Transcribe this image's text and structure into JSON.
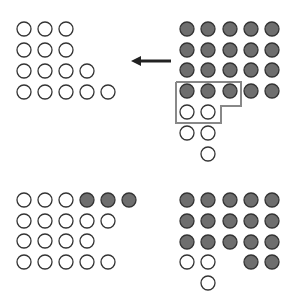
{
  "colors": {
    "background": "#ffffff",
    "filled": "#6e6e6e",
    "stroke": "#333333",
    "bracket": "#888888",
    "arrow": "#222222"
  },
  "radius": 7,
  "panels": [
    {
      "name": "top-left-after",
      "circles": [
        {
          "x": 24,
          "y": 29,
          "f": 0
        },
        {
          "x": 45,
          "y": 29,
          "f": 0
        },
        {
          "x": 66,
          "y": 29,
          "f": 0
        },
        {
          "x": 24,
          "y": 50,
          "f": 0
        },
        {
          "x": 45,
          "y": 50,
          "f": 0
        },
        {
          "x": 66,
          "y": 50,
          "f": 0
        },
        {
          "x": 24,
          "y": 71,
          "f": 0
        },
        {
          "x": 45,
          "y": 71,
          "f": 0
        },
        {
          "x": 66,
          "y": 71,
          "f": 0
        },
        {
          "x": 87,
          "y": 71,
          "f": 0
        },
        {
          "x": 24,
          "y": 92,
          "f": 0
        },
        {
          "x": 45,
          "y": 92,
          "f": 0
        },
        {
          "x": 66,
          "y": 92,
          "f": 0
        },
        {
          "x": 87,
          "y": 92,
          "f": 0
        },
        {
          "x": 108,
          "y": 92,
          "f": 0
        }
      ]
    },
    {
      "name": "top-right-before",
      "circles": [
        {
          "x": 187,
          "y": 29,
          "f": 1
        },
        {
          "x": 208,
          "y": 29,
          "f": 1
        },
        {
          "x": 230,
          "y": 29,
          "f": 1
        },
        {
          "x": 251,
          "y": 29,
          "f": 1
        },
        {
          "x": 272,
          "y": 29,
          "f": 1
        },
        {
          "x": 187,
          "y": 50,
          "f": 1
        },
        {
          "x": 208,
          "y": 50,
          "f": 1
        },
        {
          "x": 230,
          "y": 50,
          "f": 1
        },
        {
          "x": 251,
          "y": 50,
          "f": 1
        },
        {
          "x": 272,
          "y": 50,
          "f": 1
        },
        {
          "x": 187,
          "y": 70,
          "f": 1
        },
        {
          "x": 208,
          "y": 70,
          "f": 1
        },
        {
          "x": 230,
          "y": 70,
          "f": 1
        },
        {
          "x": 251,
          "y": 70,
          "f": 1
        },
        {
          "x": 272,
          "y": 70,
          "f": 1
        },
        {
          "x": 187,
          "y": 91,
          "f": 1
        },
        {
          "x": 208,
          "y": 91,
          "f": 1
        },
        {
          "x": 230,
          "y": 91,
          "f": 1
        },
        {
          "x": 251,
          "y": 91,
          "f": 1
        },
        {
          "x": 272,
          "y": 91,
          "f": 1
        },
        {
          "x": 187,
          "y": 112,
          "f": 0
        },
        {
          "x": 208,
          "y": 112,
          "f": 0
        },
        {
          "x": 187,
          "y": 133,
          "f": 0
        },
        {
          "x": 208,
          "y": 133,
          "f": 0
        },
        {
          "x": 208,
          "y": 154,
          "f": 0
        }
      ]
    },
    {
      "name": "bottom-left-result",
      "circles": [
        {
          "x": 24,
          "y": 200,
          "f": 0
        },
        {
          "x": 45,
          "y": 200,
          "f": 0
        },
        {
          "x": 66,
          "y": 200,
          "f": 0
        },
        {
          "x": 87,
          "y": 200,
          "f": 1
        },
        {
          "x": 108,
          "y": 200,
          "f": 1
        },
        {
          "x": 129,
          "y": 200,
          "f": 1
        },
        {
          "x": 24,
          "y": 221,
          "f": 0
        },
        {
          "x": 45,
          "y": 221,
          "f": 0
        },
        {
          "x": 66,
          "y": 221,
          "f": 0
        },
        {
          "x": 87,
          "y": 221,
          "f": 0
        },
        {
          "x": 108,
          "y": 221,
          "f": 0
        },
        {
          "x": 24,
          "y": 241,
          "f": 0
        },
        {
          "x": 45,
          "y": 241,
          "f": 0
        },
        {
          "x": 66,
          "y": 241,
          "f": 0
        },
        {
          "x": 87,
          "y": 241,
          "f": 0
        },
        {
          "x": 24,
          "y": 262,
          "f": 0
        },
        {
          "x": 45,
          "y": 262,
          "f": 0
        },
        {
          "x": 66,
          "y": 262,
          "f": 0
        },
        {
          "x": 87,
          "y": 262,
          "f": 0
        },
        {
          "x": 108,
          "y": 262,
          "f": 0
        }
      ]
    },
    {
      "name": "bottom-right-result",
      "circles": [
        {
          "x": 187,
          "y": 200,
          "f": 1
        },
        {
          "x": 208,
          "y": 200,
          "f": 1
        },
        {
          "x": 230,
          "y": 200,
          "f": 1
        },
        {
          "x": 251,
          "y": 200,
          "f": 1
        },
        {
          "x": 272,
          "y": 200,
          "f": 1
        },
        {
          "x": 187,
          "y": 221,
          "f": 1
        },
        {
          "x": 208,
          "y": 221,
          "f": 1
        },
        {
          "x": 230,
          "y": 221,
          "f": 1
        },
        {
          "x": 251,
          "y": 221,
          "f": 1
        },
        {
          "x": 272,
          "y": 221,
          "f": 1
        },
        {
          "x": 187,
          "y": 242,
          "f": 1
        },
        {
          "x": 208,
          "y": 242,
          "f": 1
        },
        {
          "x": 230,
          "y": 242,
          "f": 1
        },
        {
          "x": 251,
          "y": 242,
          "f": 1
        },
        {
          "x": 272,
          "y": 242,
          "f": 1
        },
        {
          "x": 187,
          "y": 262,
          "f": 0
        },
        {
          "x": 208,
          "y": 262,
          "f": 0
        },
        {
          "x": 251,
          "y": 262,
          "f": 1
        },
        {
          "x": 272,
          "y": 262,
          "f": 1
        },
        {
          "x": 208,
          "y": 283,
          "f": 0
        }
      ]
    }
  ],
  "arrow": {
    "x1": 171,
    "y1": 61,
    "x2": 131,
    "y2": 61
  },
  "bracket": {
    "points": "176,82 241,82 241,106 221,106 221,123 176,123"
  }
}
